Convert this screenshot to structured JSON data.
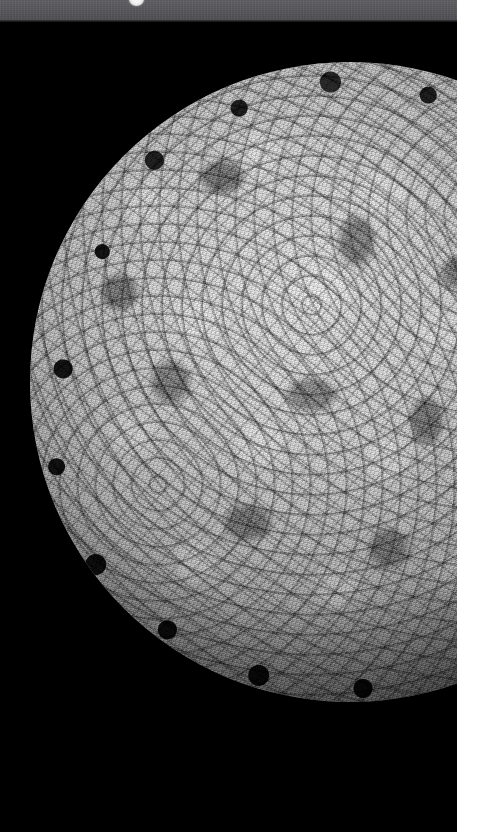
{
  "page": {
    "width": 481,
    "height": 832,
    "background_color": "#ffffff"
  },
  "toolbar": {
    "name": "viewer-toolbar",
    "background_color": "#56565a",
    "height": 22,
    "note": "Toolbar strip is clipped by the top edge of the screenshot; no label text is legible.",
    "indicator": {
      "name": "toolbar-indicator",
      "shape": "circle",
      "color": "#fdfdfd",
      "x": 136,
      "clipped": true
    }
  },
  "viewer": {
    "name": "molecular-structure-viewer",
    "background_color": "#000000",
    "render_style": "space-filling-surface",
    "color_mode": "grayscale",
    "subject": "icosahedral virus capsid",
    "caption": "Grayscale space-filling render of an icosahedral virus capsid on a black background.",
    "sphere": {
      "center_x": 350,
      "center_y": 382,
      "radius": 320,
      "highlight_color": "#e9e9e9",
      "midtone_color": "#9b9b9b",
      "shadow_color": "#3b3b3b",
      "rim_color": "#0a0a0a"
    }
  },
  "margin": {
    "name": "page-right-margin",
    "color": "#ffffff",
    "x": 457,
    "width": 24
  }
}
